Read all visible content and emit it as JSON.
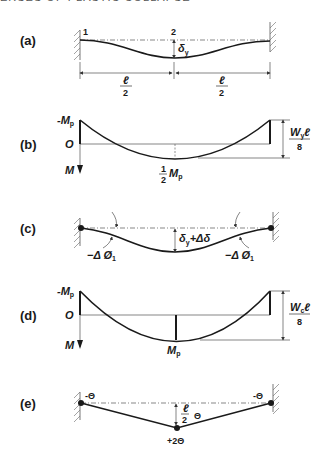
{
  "header": {
    "text": "ERSES OF PLASTIC COLLAPSE"
  },
  "panels": {
    "a": {
      "label": "(a)",
      "node_1": "1",
      "node_2": "2",
      "deflection": "δ",
      "deflection_sub": "y",
      "span_left_num": "ℓ",
      "span_left_den": "2",
      "span_right_num": "ℓ",
      "span_right_den": "2"
    },
    "b": {
      "label": "(b)",
      "neg_moment": "-M",
      "neg_moment_sub": "p",
      "origin": "O",
      "axis_label": "M",
      "mid_frac_num": "1",
      "mid_frac_den": "2",
      "mid_moment": "M",
      "mid_moment_sub": "p",
      "dim_num": "W",
      "dim_num_sub": "y",
      "dim_num_l": "ℓ",
      "dim_den": "8"
    },
    "c": {
      "label": "(c)",
      "deflection": "δ",
      "deflection_sub": "y",
      "deflection_increment": "+Δδ",
      "rotation_left": "−Δ Ø",
      "rotation_left_sub": "1",
      "rotation_right": "−Δ Ø",
      "rotation_right_sub": "1"
    },
    "d": {
      "label": "(d)",
      "neg_moment": "-M",
      "neg_moment_sub": "p",
      "origin": "O",
      "axis_label": "M",
      "mid_moment": "M",
      "mid_moment_sub": "p",
      "dim_num": "W",
      "dim_num_sub": "c",
      "dim_num_l": "ℓ",
      "dim_den": "8"
    },
    "e": {
      "label": "(e)",
      "rotation_left": "-Θ",
      "rotation_right": "-Θ",
      "mid_frac_num": "ℓ",
      "mid_frac_den": "2",
      "mid_theta": "Θ",
      "hinge_rotation": "+2Θ"
    }
  }
}
